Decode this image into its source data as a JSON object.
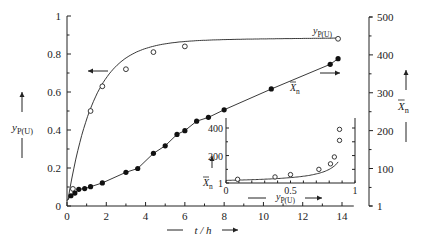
{
  "chart_data": [
    {
      "type": "line",
      "title": "",
      "xlabel": "t / h",
      "ylabel_left": "y_P(U)",
      "ylabel_right": "X̄n",
      "xlim": [
        0,
        15
      ],
      "ylim_left": [
        0,
        1
      ],
      "ylim_right": [
        1,
        500
      ],
      "x_ticks": [
        0,
        2,
        4,
        6,
        8,
        10,
        12,
        14
      ],
      "y_ticks_left": [
        0,
        0.2,
        0.4,
        0.6,
        0.8,
        1
      ],
      "y_ticks_right": [
        1,
        100,
        200,
        300,
        400,
        500
      ],
      "grid": false,
      "series": [
        {
          "name": "y_P(U)",
          "axis": "left",
          "marker": "open-circle",
          "x": [
            0.3,
            1.2,
            1.8,
            3.0,
            4.4,
            6.0,
            13.8
          ],
          "y": [
            0.09,
            0.5,
            0.63,
            0.72,
            0.81,
            0.84,
            0.88
          ]
        },
        {
          "name": "X̄n",
          "axis": "right",
          "marker": "filled-circle",
          "x": [
            0.2,
            0.4,
            0.6,
            0.9,
            1.2,
            1.8,
            3.0,
            3.6,
            4.4,
            5.0,
            5.6,
            6.0,
            6.6,
            7.2,
            8.0,
            10.4,
            13.4,
            13.8
          ],
          "y": [
            28,
            35,
            45,
            47,
            52,
            62,
            90,
            100,
            140,
            160,
            190,
            200,
            225,
            235,
            255,
            310,
            375,
            390
          ]
        }
      ],
      "annotations": [
        {
          "text": "y_P(U)",
          "near": "top curve end"
        },
        {
          "text": "X̄n",
          "near": "lower curve"
        },
        {
          "text": "←",
          "meaning": "y_P(U) curve refers to left axis"
        },
        {
          "text": "→",
          "meaning": "X̄n curve refers to right axis"
        }
      ]
    },
    {
      "type": "scatter",
      "title": "inset",
      "xlabel": "y_P(U)",
      "ylabel": "X̄n",
      "xlim": [
        0,
        1
      ],
      "ylim": [
        1,
        500
      ],
      "x_ticks": [
        0,
        0.5,
        1
      ],
      "y_ticks": [
        1,
        200,
        400
      ],
      "marker": "open-circle",
      "x": [
        0.09,
        0.38,
        0.5,
        0.72,
        0.81,
        0.84,
        0.88,
        0.88
      ],
      "y": [
        28,
        45,
        62,
        100,
        140,
        190,
        310,
        390
      ]
    }
  ],
  "labels": {
    "left_axis": {
      "main": "y",
      "sub": "P(U)"
    },
    "right_axis": {
      "main": "X",
      "sub": "n"
    },
    "x_axis": "t / h",
    "curve_y": {
      "main": "y",
      "sub": "P(U)"
    },
    "curve_x": {
      "main": "X",
      "sub": "n"
    },
    "inset_x": {
      "main": "y",
      "sub": "P(U)"
    },
    "inset_y": {
      "main": "X",
      "sub": "n"
    }
  }
}
